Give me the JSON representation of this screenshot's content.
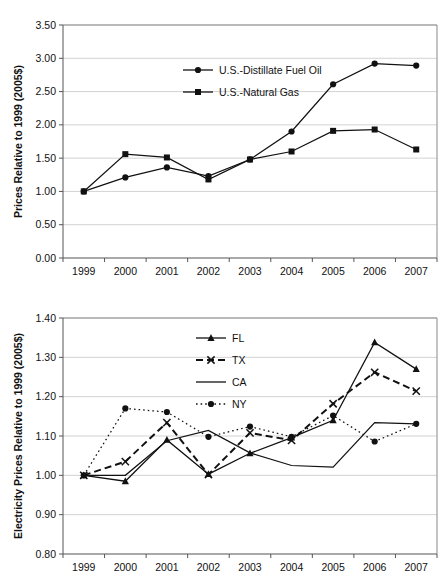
{
  "figure": {
    "name": "two-panel-energy-price-index-figure",
    "panel_count": 2
  },
  "chart_data": [
    {
      "id": "top",
      "type": "line",
      "title": "",
      "xlabel": "",
      "ylabel": "Prices Relative to 1999 (2005$)",
      "categories": [
        "1999",
        "2000",
        "2001",
        "2002",
        "2003",
        "2004",
        "2005",
        "2006",
        "2007"
      ],
      "x": [
        1999,
        2000,
        2001,
        2002,
        2003,
        2004,
        2005,
        2006,
        2007
      ],
      "ylim": [
        0.0,
        3.5
      ],
      "yticks": [
        0.0,
        0.5,
        1.0,
        1.5,
        2.0,
        2.5,
        3.0,
        3.5
      ],
      "ytick_labels": [
        "0.00",
        "0.50",
        "1.00",
        "1.50",
        "2.00",
        "2.50",
        "3.00",
        "3.50"
      ],
      "grid": true,
      "legend_position": "upper-center-left",
      "series": [
        {
          "name": "U.S.-Distillate Fuel Oil",
          "marker": "circle",
          "dash": "solid",
          "color": "#111111",
          "values": [
            1.0,
            1.21,
            1.36,
            1.23,
            1.48,
            1.9,
            2.61,
            2.92,
            2.89
          ]
        },
        {
          "name": "U.S.-Natural Gas",
          "marker": "square",
          "dash": "solid",
          "color": "#111111",
          "values": [
            1.0,
            1.56,
            1.51,
            1.18,
            1.48,
            1.6,
            1.91,
            1.93,
            1.63
          ]
        }
      ]
    },
    {
      "id": "bottom",
      "type": "line",
      "title": "",
      "xlabel": "",
      "ylabel": "Electricity Prices Relative to 1999 (2005$)",
      "categories": [
        "1999",
        "2000",
        "2001",
        "2002",
        "2003",
        "2004",
        "2005",
        "2006",
        "2007"
      ],
      "x": [
        1999,
        2000,
        2001,
        2002,
        2003,
        2004,
        2005,
        2006,
        2007
      ],
      "ylim": [
        0.8,
        1.4
      ],
      "yticks": [
        0.8,
        0.9,
        1.0,
        1.1,
        1.2,
        1.3,
        1.4
      ],
      "ytick_labels": [
        "0.80",
        "0.90",
        "1.00",
        "1.10",
        "1.20",
        "1.30",
        "1.40"
      ],
      "grid": true,
      "legend_position": "upper-center",
      "series": [
        {
          "name": "FL",
          "marker": "triangle",
          "dash": "solid",
          "color": "#111111",
          "values": [
            1.0,
            0.985,
            1.09,
            1.003,
            1.056,
            1.096,
            1.14,
            1.338,
            1.27
          ]
        },
        {
          "name": "TX",
          "marker": "x",
          "dash": "dashed",
          "color": "#111111",
          "values": [
            1.0,
            1.035,
            1.134,
            1.002,
            1.108,
            1.089,
            1.182,
            1.262,
            1.214
          ]
        },
        {
          "name": "CA",
          "marker": "none",
          "dash": "solid",
          "color": "#111111",
          "values": [
            1.0,
            1.0,
            1.088,
            1.114,
            1.057,
            1.025,
            1.021,
            1.134,
            1.131
          ]
        },
        {
          "name": "NY",
          "marker": "circle",
          "dash": "dotted",
          "color": "#111111",
          "values": [
            1.0,
            1.17,
            1.161,
            1.098,
            1.124,
            1.098,
            1.152,
            1.086,
            1.131
          ]
        }
      ]
    }
  ]
}
